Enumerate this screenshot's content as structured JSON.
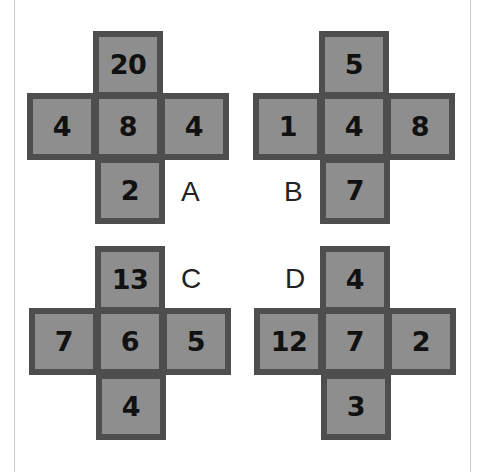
{
  "puzzle": {
    "crosses": [
      {
        "label": "A",
        "top": "20",
        "left": "4",
        "center": "8",
        "right": "4",
        "bottom": "2"
      },
      {
        "label": "B",
        "top": "5",
        "left": "1",
        "center": "4",
        "right": "8",
        "bottom": "7"
      },
      {
        "label": "C",
        "top": "13",
        "left": "7",
        "center": "6",
        "right": "5",
        "bottom": "4"
      },
      {
        "label": "D",
        "top": "4",
        "left": "12",
        "center": "7",
        "right": "2",
        "bottom": "3"
      }
    ]
  },
  "colors": {
    "cell_fill": "#8e8e8e",
    "cell_border": "#4e4e4e",
    "digit": "#111111",
    "background": "#ffffff"
  }
}
